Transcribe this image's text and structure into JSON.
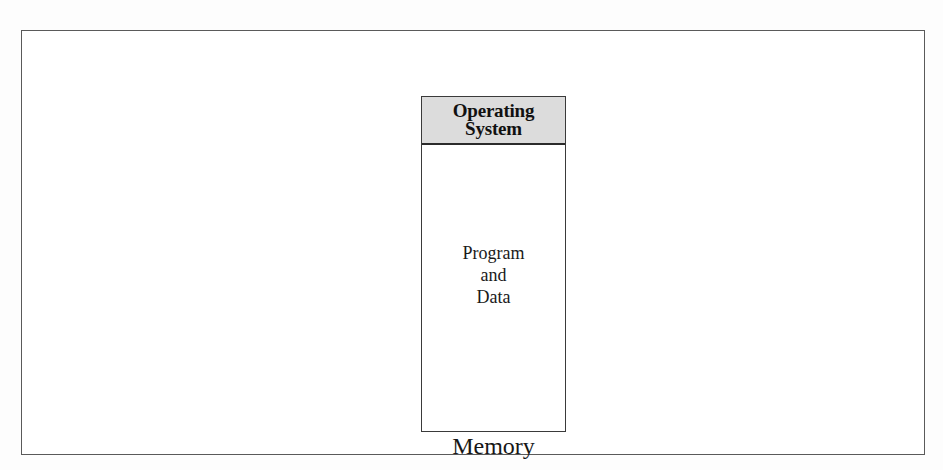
{
  "figure": {
    "caption": "Memory",
    "frame": {
      "border_color": "#5a5a5a",
      "background": "#ffffff"
    },
    "background": "#fdfdfd"
  },
  "memory_block": {
    "border_color": "#3a3a3a",
    "partitions": [
      {
        "name": "operating-system",
        "label": "Operating\nSystem",
        "fill": "#dcdcdc",
        "text_style": "bold",
        "divider_color": "#2b2b2b"
      },
      {
        "name": "user-area",
        "label": "Program\nand\nData",
        "fill": "#ffffff",
        "text_style": "regular"
      }
    ]
  }
}
